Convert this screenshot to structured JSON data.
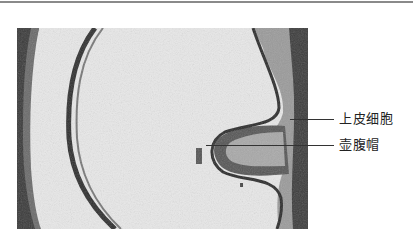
{
  "figure": {
    "type": "micrograph",
    "labels": [
      {
        "text": "上皮细胞"
      },
      {
        "text": "壶腹帽"
      }
    ]
  }
}
